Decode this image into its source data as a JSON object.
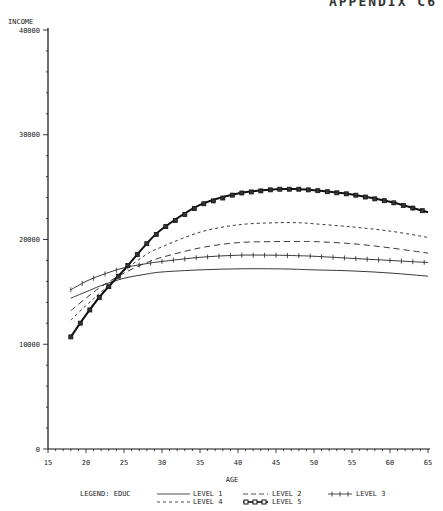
{
  "header": {
    "text": "APPENDIX C6"
  },
  "chart_data": {
    "type": "line",
    "title": "",
    "xlabel": "AGE",
    "ylabel": "INCOME",
    "xlim": [
      15,
      65
    ],
    "ylim": [
      0,
      40000
    ],
    "x_ticks": [
      "15",
      "20",
      "25",
      "30",
      "35",
      "40",
      "45",
      "50",
      "55",
      "60",
      "65"
    ],
    "y_ticks": [
      "0",
      "10000",
      "20000",
      "30000",
      "40000"
    ],
    "grid": false,
    "legend_title": "LEGEND: EDUC",
    "legend_position": "bottom",
    "x": [
      18,
      20,
      22,
      25,
      28,
      30,
      35,
      40,
      45,
      48,
      50,
      55,
      60,
      65
    ],
    "series": [
      {
        "name": "LEVEL 1",
        "style": "solid",
        "values": [
          14400,
          15000,
          15600,
          16300,
          16700,
          16900,
          17100,
          17200,
          17200,
          17150,
          17100,
          17000,
          16800,
          16500
        ]
      },
      {
        "name": "LEVEL 2",
        "style": "long-dash",
        "values": [
          13200,
          14400,
          15500,
          16800,
          17800,
          18300,
          19200,
          19700,
          19800,
          19800,
          19800,
          19600,
          19200,
          18700
        ]
      },
      {
        "name": "LEVEL 3",
        "style": "plus-marker",
        "values": [
          15200,
          16000,
          16600,
          17300,
          17700,
          17900,
          18300,
          18500,
          18500,
          18450,
          18400,
          18200,
          18000,
          17800
        ]
      },
      {
        "name": "LEVEL 4",
        "style": "short-dash",
        "values": [
          12300,
          13700,
          15000,
          17000,
          18600,
          19300,
          20700,
          21400,
          21600,
          21600,
          21500,
          21200,
          20800,
          20200
        ]
      },
      {
        "name": "LEVEL 5",
        "style": "square-marker-bold",
        "values": [
          10700,
          12800,
          14700,
          17100,
          19600,
          21000,
          23300,
          24400,
          24800,
          24800,
          24700,
          24300,
          23600,
          22600
        ]
      }
    ]
  },
  "legend": {
    "title": "LEGEND: EDUC",
    "items": [
      {
        "label": "LEVEL 1"
      },
      {
        "label": "LEVEL 2"
      },
      {
        "label": "LEVEL 3"
      },
      {
        "label": "LEVEL 4"
      },
      {
        "label": "LEVEL 5"
      }
    ]
  }
}
